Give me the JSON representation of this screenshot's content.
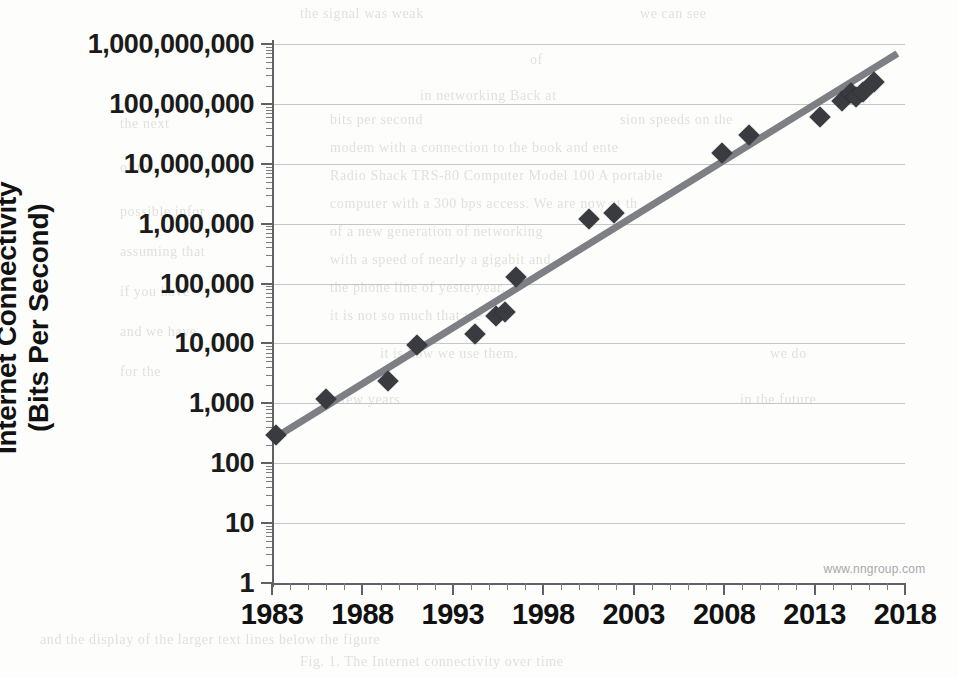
{
  "chart_data": {
    "type": "scatter",
    "title": "",
    "xlabel": "",
    "ylabel": "Internet Connectivity (Bits Per Second)",
    "ylabel_line1": "Internet Connectivity",
    "ylabel_line2": "(Bits Per Second)",
    "yscale": "log",
    "ylim": [
      1,
      1000000000
    ],
    "xlim": [
      1983,
      2018
    ],
    "grid": true,
    "legend": null,
    "ytick_labels": [
      "1,000,000,000",
      "100,000,000",
      "10,000,000",
      "1,000,000",
      "100,000",
      "10,000",
      "1,000",
      "100",
      "10",
      "1"
    ],
    "ytick_values": [
      1000000000,
      100000000,
      10000000,
      1000000,
      100000,
      10000,
      1000,
      100,
      10,
      1
    ],
    "xtick_labels": [
      "1983",
      "1988",
      "1993",
      "1998",
      "2003",
      "2008",
      "2013",
      "2018"
    ],
    "xtick_values": [
      1983,
      1988,
      1993,
      1998,
      2003,
      2008,
      2013,
      2018
    ],
    "x_minor_step": 1,
    "series": [
      {
        "name": "Internet connectivity speed",
        "marker": "diamond",
        "color": "#3a3b40",
        "points": [
          {
            "x": 1983.2,
            "y": 300
          },
          {
            "x": 1986.0,
            "y": 1200
          },
          {
            "x": 1989.4,
            "y": 2400
          },
          {
            "x": 1991.0,
            "y": 9600
          },
          {
            "x": 1994.2,
            "y": 14400
          },
          {
            "x": 1995.4,
            "y": 28800
          },
          {
            "x": 1995.9,
            "y": 33600
          },
          {
            "x": 1996.5,
            "y": 128000
          },
          {
            "x": 2000.5,
            "y": 1200000
          },
          {
            "x": 2001.9,
            "y": 1500000
          },
          {
            "x": 2007.9,
            "y": 15000000
          },
          {
            "x": 2009.4,
            "y": 30000000
          },
          {
            "x": 2013.3,
            "y": 60000000
          },
          {
            "x": 2014.5,
            "y": 110000000
          },
          {
            "x": 2015.0,
            "y": 150000000
          },
          {
            "x": 2015.3,
            "y": 130000000
          },
          {
            "x": 2015.7,
            "y": 160000000
          },
          {
            "x": 2016.3,
            "y": 230000000
          }
        ]
      }
    ],
    "trendline": {
      "name": "exponential trend",
      "color": "#77787d",
      "x_start": 1983.0,
      "y_start": 250,
      "x_end": 2017.6,
      "y_end": 700000000
    },
    "annotations": [
      {
        "name": "watermark",
        "text": "www.nngroup.com",
        "x": 2013.5,
        "y": 2.2
      }
    ]
  },
  "bleed_text": {
    "note": "faint show-through text from reverse of scanned page",
    "lines": [
      {
        "t": "the signal was weak",
        "x": 300,
        "y": 6
      },
      {
        "t": "we can see",
        "x": 640,
        "y": 6
      },
      {
        "t": "of",
        "x": 530,
        "y": 52
      },
      {
        "t": "in networking  Back  at",
        "x": 420,
        "y": 88
      },
      {
        "t": "bits per  second",
        "x": 330,
        "y": 112
      },
      {
        "t": "sion  speeds  on  the",
        "x": 620,
        "y": 112
      },
      {
        "t": "modem with a connection to the  book  and  ente",
        "x": 330,
        "y": 140
      },
      {
        "t": "Radio  Shack  TRS-80  Computer  Model  100  A  portable",
        "x": 330,
        "y": 168
      },
      {
        "t": "computer  with  a  300  bps  access.  We  are  now  at  th",
        "x": 330,
        "y": 196
      },
      {
        "t": "of  a  new  generation  of  networking",
        "x": 330,
        "y": 224
      },
      {
        "t": "with  a  speed  of  nearly  a  gigabit  and",
        "x": 330,
        "y": 252
      },
      {
        "t": "the  phone  line  of  yesteryear.",
        "x": 330,
        "y": 280
      },
      {
        "t": "it  is  not  so  much  that  we",
        "x": 330,
        "y": 308
      },
      {
        "t": "it  is  how  we  use  them.",
        "x": 380,
        "y": 346
      },
      {
        "t": "we  do",
        "x": 770,
        "y": 346
      },
      {
        "t": "a  few  years",
        "x": 330,
        "y": 392
      },
      {
        "t": "in  the  future",
        "x": 740,
        "y": 392
      },
      {
        "t": "the  next",
        "x": 120,
        "y": 116
      },
      {
        "t": "of  to",
        "x": 120,
        "y": 160
      },
      {
        "t": "possible  infor",
        "x": 120,
        "y": 204
      },
      {
        "t": "assuming  that",
        "x": 120,
        "y": 244
      },
      {
        "t": "if  you  have",
        "x": 120,
        "y": 284
      },
      {
        "t": "and  we  have",
        "x": 120,
        "y": 324
      },
      {
        "t": "for  the",
        "x": 120,
        "y": 364
      },
      {
        "t": "and  the  display  of  the  larger  text  lines  below  the  figure",
        "x": 40,
        "y": 632
      },
      {
        "t": "Fig. 1.  The  Internet  connectivity  over  time",
        "x": 300,
        "y": 654
      },
      {
        "t": "H",
        "x": 920,
        "y": 612
      }
    ]
  }
}
